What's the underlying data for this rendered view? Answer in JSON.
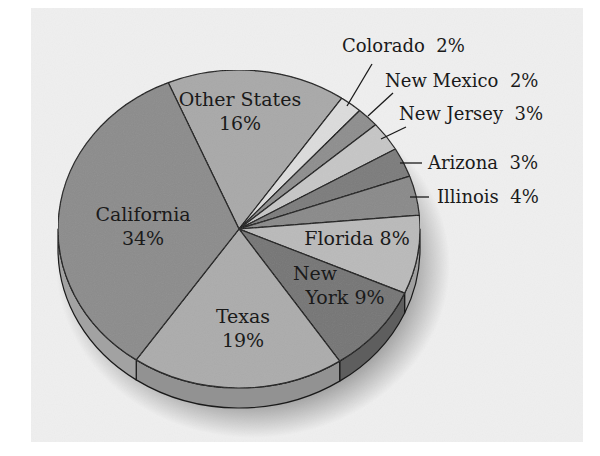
{
  "chart_data": {
    "type": "pie",
    "title": "",
    "style": "3d-tilted",
    "background_color": "#efefef",
    "start_angle_deg": 247,
    "direction": "clockwise",
    "slices": [
      {
        "label": "Other States",
        "value": 16,
        "display": "16%",
        "color": "#a9a9a9",
        "side_color": "#8f8f8f",
        "label_mode": "inside",
        "label_lines": [
          "Other States",
          "16%"
        ],
        "label_x": 240,
        "label_y": 106
      },
      {
        "label": "Colorado",
        "value": 2,
        "display": "2%",
        "color": "#dcdcdc",
        "side_color": "#c4c4c4",
        "label_mode": "outside",
        "label_text": "Colorado  2%",
        "label_x": 342,
        "label_y": 52,
        "leader": [
          372,
          64,
          347,
          106
        ]
      },
      {
        "label": "New Mexico",
        "value": 2,
        "display": "2%",
        "color": "#8e8e8e",
        "side_color": "#747474",
        "label_mode": "outside",
        "label_text": "New Mexico  2%",
        "label_x": 385,
        "label_y": 87,
        "leader": [
          393,
          93,
          368,
          116
        ]
      },
      {
        "label": "New Jersey",
        "value": 3,
        "display": "3%",
        "color": "#c6c6c6",
        "side_color": "#adadad",
        "label_mode": "outside",
        "label_text": "New Jersey  3%",
        "label_x": 399,
        "label_y": 120,
        "leader": [
          406,
          127,
          381,
          139
        ]
      },
      {
        "label": "Arizona",
        "value": 3,
        "display": "3%",
        "color": "#7c7c7c",
        "side_color": "#636363",
        "label_mode": "outside",
        "label_text": "Arizona  3%",
        "label_x": 428,
        "label_y": 169,
        "leader": [
          422,
          163,
          400,
          163
        ]
      },
      {
        "label": "Illinois",
        "value": 4,
        "display": "4%",
        "color": "#8a8a8a",
        "side_color": "#717171",
        "label_mode": "outside",
        "label_text": "Illinois  4%",
        "label_x": 437,
        "label_y": 203,
        "leader": [
          429,
          197,
          410,
          197
        ]
      },
      {
        "label": "Florida",
        "value": 8,
        "display": "8%",
        "color": "#bababa",
        "side_color": "#a0a0a0",
        "label_mode": "inside",
        "label_lines": [
          "Florida 8%"
        ],
        "label_x": 357,
        "label_y": 245
      },
      {
        "label": "New York",
        "value": 9,
        "display": "9%",
        "color": "#767676",
        "side_color": "#5e5e5e",
        "label_mode": "inside",
        "label_lines": [
          "New",
          "York 9%"
        ],
        "label_x": 345,
        "label_y": 280,
        "line_offsets": [
          -30,
          0
        ]
      },
      {
        "label": "Texas",
        "value": 19,
        "display": "19%",
        "color": "#acacac",
        "side_color": "#929292",
        "label_mode": "inside",
        "label_lines": [
          "Texas",
          "19%"
        ],
        "label_x": 243,
        "label_y": 323
      },
      {
        "label": "California",
        "value": 34,
        "display": "34%",
        "color": "#8c8c8c",
        "side_color": "#a2a2a2",
        "label_mode": "inside",
        "label_lines": [
          "California",
          "34%"
        ],
        "label_x": 143,
        "label_y": 221
      }
    ],
    "geometry": {
      "cx": 239,
      "cy": 229,
      "rx": 181,
      "ry": 159,
      "depth": 20
    },
    "panel": {
      "x": 31,
      "y": 8,
      "width": 552,
      "height": 434
    }
  }
}
